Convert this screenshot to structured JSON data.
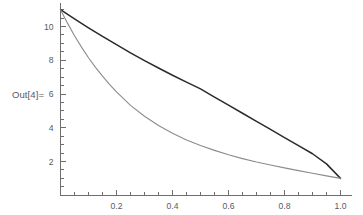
{
  "out_label": {
    "text": "Out[4]="
  },
  "chart_data": {
    "type": "line",
    "title": "",
    "xlabel": "",
    "ylabel": "",
    "xlim": [
      0,
      1.04
    ],
    "ylim": [
      0,
      11.4
    ],
    "grid": false,
    "legend": "none",
    "xticks": [
      0.2,
      0.4,
      0.6,
      0.8,
      1.0
    ],
    "xtick_labels": [
      "0.2",
      "0.4",
      "0.6",
      "0.8",
      "1.0"
    ],
    "x_minor_ticks": [
      0.05,
      0.1,
      0.15,
      0.25,
      0.3,
      0.35,
      0.45,
      0.5,
      0.55,
      0.65,
      0.7,
      0.75,
      0.85,
      0.9,
      0.95
    ],
    "yticks": [
      2,
      4,
      6,
      8,
      10
    ],
    "ytick_labels": [
      "2",
      "4",
      "6",
      "8",
      "10"
    ],
    "y_minor_ticks": [
      0.5,
      1,
      1.5,
      2.5,
      3,
      3.5,
      4.5,
      5,
      5.5,
      6.5,
      7,
      7.5,
      8.5,
      9,
      9.5,
      10.5,
      11
    ],
    "axis_color": "#6e6e6e",
    "series": [
      {
        "name": "upper-curve",
        "color": "#2b2b2b",
        "width": 1.5,
        "x": [
          0.0,
          0.05,
          0.1,
          0.15,
          0.2,
          0.25,
          0.3,
          0.35,
          0.4,
          0.45,
          0.5,
          0.55,
          0.6,
          0.65,
          0.7,
          0.75,
          0.8,
          0.85,
          0.9,
          0.95,
          1.0
        ],
        "y": [
          11.0,
          10.45,
          9.92,
          9.41,
          8.92,
          8.44,
          7.98,
          7.54,
          7.11,
          6.7,
          6.3,
          5.82,
          5.34,
          4.86,
          4.38,
          3.9,
          3.42,
          2.94,
          2.46,
          1.86,
          1.0
        ]
      },
      {
        "name": "lower-curve",
        "color": "#8c8c8c",
        "width": 1.1,
        "x": [
          0.0,
          0.025,
          0.05,
          0.075,
          0.1,
          0.125,
          0.15,
          0.175,
          0.2,
          0.25,
          0.3,
          0.35,
          0.4,
          0.45,
          0.5,
          0.55,
          0.6,
          0.65,
          0.7,
          0.75,
          0.8,
          0.85,
          0.9,
          0.95,
          1.0
        ],
        "y": [
          11.0,
          10.2,
          9.45,
          8.78,
          8.15,
          7.58,
          7.06,
          6.57,
          6.12,
          5.33,
          4.68,
          4.13,
          3.67,
          3.28,
          2.95,
          2.66,
          2.4,
          2.17,
          1.97,
          1.79,
          1.62,
          1.46,
          1.3,
          1.15,
          1.0
        ]
      }
    ]
  }
}
